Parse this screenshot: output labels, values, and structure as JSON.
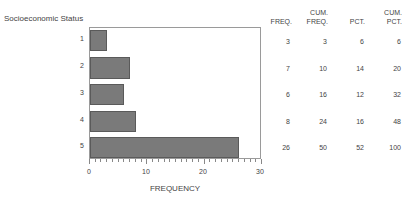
{
  "chart_data": {
    "type": "bar",
    "orientation": "horizontal",
    "title": "",
    "ylabel": "Socioeconomic Status",
    "xlabel": "FREQUENCY",
    "categories": [
      "1",
      "2",
      "3",
      "4",
      "5"
    ],
    "values": [
      3,
      7,
      6,
      8,
      26
    ],
    "xlim": [
      0,
      30
    ],
    "x_ticks": [
      "0",
      "10",
      "20",
      "30"
    ],
    "grid": false,
    "legend": null,
    "table": {
      "columns": [
        "FREQ.",
        "CUM. FREQ.",
        "PCT.",
        "CUM. PCT."
      ],
      "rows": [
        {
          "freq": "3",
          "cum_freq": "3",
          "pct": "6",
          "cum_pct": "6"
        },
        {
          "freq": "7",
          "cum_freq": "10",
          "pct": "14",
          "cum_pct": "20"
        },
        {
          "freq": "6",
          "cum_freq": "16",
          "pct": "12",
          "cum_pct": "32"
        },
        {
          "freq": "8",
          "cum_freq": "24",
          "pct": "16",
          "cum_pct": "48"
        },
        {
          "freq": "26",
          "cum_freq": "50",
          "pct": "52",
          "cum_pct": "100"
        }
      ]
    }
  },
  "headers": {
    "freq": "FREQ.",
    "cum_freq_1": "CUM.",
    "cum_freq_2": "FREQ.",
    "pct": "PCT.",
    "cum_pct_1": "CUM.",
    "cum_pct_2": "PCT."
  },
  "colors": {
    "bar_fill": "#7a7a7a",
    "bar_border": "#5a5a5a",
    "axis": "#9a9a9a"
  }
}
